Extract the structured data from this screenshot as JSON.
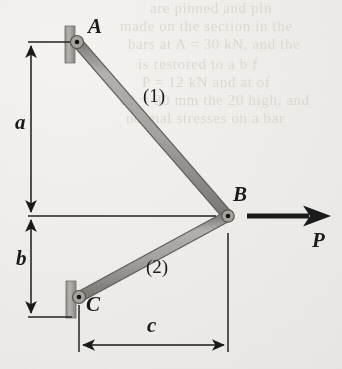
{
  "figure": {
    "kind": "statics-free-body-diagram",
    "background_color": "#f1f0ec",
    "ink_color": "#1a1a1a",
    "bar_fill_color": "#a8a7a3",
    "bar_edge_color": "#6e6d69",
    "support_fill_color": "#a8a7a3"
  },
  "joints": [
    {
      "name": "A",
      "label": "A",
      "x": 77,
      "y": 42,
      "type": "wall-pin"
    },
    {
      "name": "B",
      "label": "B",
      "x": 228,
      "y": 216,
      "type": "free-pin"
    },
    {
      "name": "C",
      "label": "C",
      "x": 79,
      "y": 297,
      "type": "wall-pin"
    }
  ],
  "members": [
    {
      "name": "member-1",
      "label": "(1)",
      "from": "A",
      "to": "B"
    },
    {
      "name": "member-2",
      "label": "(2)",
      "from": "C",
      "to": "B"
    }
  ],
  "load": {
    "label": "P",
    "direction": "right",
    "applied_at": "B",
    "shaft_from_x": 247,
    "shaft_to_x": 322,
    "y": 216
  },
  "dimensions": [
    {
      "name": "dimension-a",
      "label": "a",
      "orientation": "vertical",
      "from_y": 42,
      "to_y": 216,
      "x": 31
    },
    {
      "name": "dimension-b",
      "label": "b",
      "orientation": "vertical",
      "from_y": 216,
      "to_y": 317,
      "x": 31
    },
    {
      "name": "dimension-c",
      "label": "c",
      "orientation": "horizontal",
      "from_x": 79,
      "to_x": 228,
      "y": 345
    }
  ],
  "ghost_text": {
    "note": "faint bleed-through lines from reverse side of the scanned page; not legible",
    "lines": [
      {
        "text": "are pinned and pin",
        "x": 150,
        "y": 2
      },
      {
        "text": "made on the section in the",
        "x": 120,
        "y": 20
      },
      {
        "text": "bars at A = 30 kN, and the",
        "x": 128,
        "y": 38
      },
      {
        "text": "is restored to a b f",
        "x": 138,
        "y": 58
      },
      {
        "text": "P = 12 kN and at of",
        "x": 142,
        "y": 76
      },
      {
        "text": "d2 = 30 mm the 20 high, and",
        "x": 120,
        "y": 94
      },
      {
        "text": "normal stresses on a bar",
        "x": 126,
        "y": 112
      }
    ]
  }
}
